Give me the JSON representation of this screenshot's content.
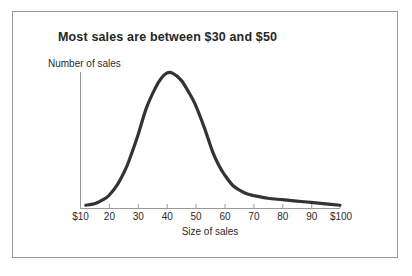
{
  "figure": {
    "background_color": "#ffffff",
    "frame_color": "#9a9a9a",
    "curve_color": "#333333",
    "axis_color": "#9a9a9a",
    "text_color": "#2b2b2b"
  },
  "chart_data": {
    "type": "line",
    "title": "Most sales are between $30 and $50",
    "subtitle": "",
    "xlabel": "Size of sales",
    "ylabel": "Number of sales",
    "xlim": [
      10,
      100
    ],
    "ylim": [
      0,
      100
    ],
    "grid": false,
    "legend": "none",
    "xtick_labels": [
      "$10",
      "20",
      "30",
      "40",
      "50",
      "60",
      "70",
      "80",
      "90",
      "$100"
    ],
    "xtick_values": [
      10,
      20,
      30,
      40,
      50,
      60,
      70,
      80,
      90,
      100
    ],
    "ytick_labels": [],
    "annotations": [],
    "series": [
      {
        "name": "Number of sales",
        "x": [
          12,
          15,
          18,
          20,
          23,
          26,
          28,
          30,
          33,
          36,
          38,
          40,
          42,
          45,
          48,
          50,
          53,
          56,
          58,
          60,
          63,
          66,
          68,
          70,
          75,
          80,
          85,
          90,
          95,
          100
        ],
        "values": [
          2,
          3,
          6,
          9,
          17,
          29,
          40,
          52,
          72,
          86,
          93,
          97,
          97,
          92,
          82,
          74,
          58,
          40,
          31,
          24,
          16,
          12,
          10,
          9,
          7,
          6,
          5,
          4,
          3,
          2
        ]
      }
    ]
  }
}
